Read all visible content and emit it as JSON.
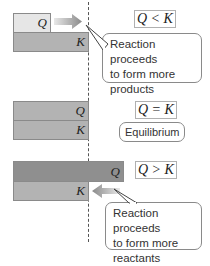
{
  "diagram": {
    "dashed_line_meaning": "equilibrium-position",
    "sections": [
      {
        "relation": "Q < K",
        "q_label": "Q",
        "k_label": "K",
        "q_color": "#e6e6e6",
        "k_color": "#b3b3b3",
        "arrow_direction": "right",
        "callout": "Reaction proceeds to form more products",
        "callout_lines": [
          "Reaction proceeds",
          "to form more",
          "products"
        ]
      },
      {
        "relation": "Q = K",
        "q_label": "Q",
        "k_label": "K",
        "q_color": "#b3b3b3",
        "k_color": "#b3b3b3",
        "callout": "Equilibrium"
      },
      {
        "relation": "Q > K",
        "q_label": "Q",
        "k_label": "K",
        "q_color": "#8f8f8f",
        "k_color": "#b3b3b3",
        "arrow_direction": "left",
        "callout": "Reaction proceeds to form more reactants",
        "callout_lines": [
          "Reaction proceeds",
          "to form more",
          "reactants"
        ]
      }
    ]
  }
}
